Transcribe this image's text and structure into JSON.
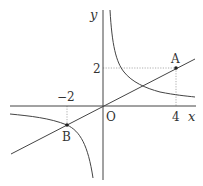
{
  "diagram": {
    "type": "coordinate-plane",
    "axes": {
      "x_label": "x",
      "y_label": "y",
      "origin_label": "O"
    },
    "ticks": {
      "x_positive": "4",
      "x_negative": "−2",
      "y_positive": "2"
    },
    "points": [
      {
        "label": "A",
        "x": 4,
        "y": 2
      },
      {
        "label": "B",
        "x": -2,
        "y": -1
      }
    ],
    "curves": [
      {
        "kind": "line-through-origin",
        "description": "line through O, A and B"
      },
      {
        "kind": "hyperbola",
        "description": "two-branch hyperbola in quadrants I and III"
      }
    ],
    "colors": {
      "stroke": "#444444",
      "dotted": "#888888",
      "text": "#333333"
    }
  }
}
